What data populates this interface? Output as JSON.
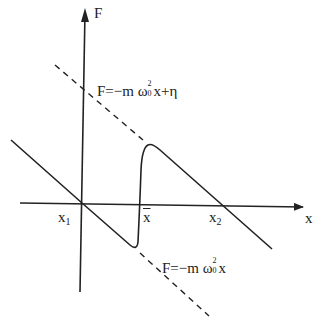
{
  "diagram": {
    "axes": {
      "y_label": "F",
      "x_label": "x"
    },
    "points": {
      "x1": {
        "base": "x",
        "sub": "1"
      },
      "xbar": "x",
      "x2": {
        "base": "x",
        "sub": "2"
      }
    },
    "upper_line": {
      "prefix": "F=−m ",
      "omega": "ω",
      "sup": "2",
      "sub": "0",
      "suffix": "x+η",
      "style": "dashed"
    },
    "lower_line": {
      "prefix": "F=−m ",
      "omega": "ω",
      "sup": "2",
      "sub": "0",
      "suffix": "x",
      "style": "dashed"
    },
    "colors": {
      "stroke": "#222222",
      "background": "#ffffff"
    }
  }
}
